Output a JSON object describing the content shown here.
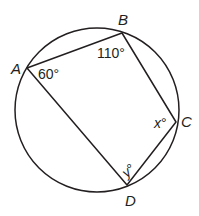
{
  "diagram": {
    "type": "cyclic-quadrilateral",
    "circle": {
      "cx": 97,
      "cy": 110,
      "r": 82
    },
    "vertices": {
      "A": {
        "label": "A",
        "x": 27,
        "y": 68
      },
      "B": {
        "label": "B",
        "x": 122,
        "y": 33
      },
      "C": {
        "label": "C",
        "x": 176,
        "y": 122
      },
      "D": {
        "label": "D",
        "x": 127,
        "y": 185
      }
    },
    "angles": {
      "A": "60°",
      "B": "110°",
      "C_var": "x",
      "C_deg": "°",
      "D_var": "y",
      "D_deg": "°"
    },
    "colors": {
      "stroke": "#231f20",
      "background": "#ffffff"
    }
  }
}
